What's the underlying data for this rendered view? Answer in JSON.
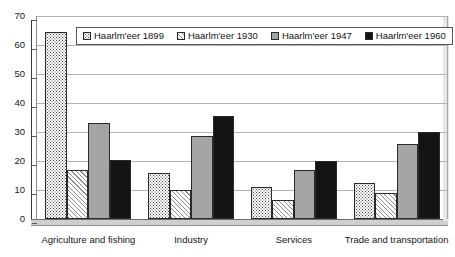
{
  "chart_data": {
    "type": "bar",
    "title": "",
    "subtitle": "",
    "xlabel": "",
    "ylabel": "",
    "ylim": [
      0,
      70
    ],
    "ytick_interval": 10,
    "yticks": [
      "0",
      "10",
      "20",
      "30",
      "40",
      "50",
      "60",
      "70"
    ],
    "grid": true,
    "legend_position": "top-center",
    "categories": [
      "Agriculture and fishing",
      "Industry",
      "Services",
      "Trade and transportation"
    ],
    "series": [
      {
        "name": "Haarlm'eer 1899",
        "pattern": "dots",
        "values": [
          64.5,
          16,
          11,
          12.5
        ]
      },
      {
        "name": "Haarlm'eer 1930",
        "pattern": "diagonal-hatch",
        "values": [
          17,
          10,
          6.5,
          9
        ]
      },
      {
        "name": "Haarlm'eer 1947",
        "pattern": "solid-gray",
        "color": "#a5a5a5",
        "values": [
          33,
          28.5,
          17,
          26
        ]
      },
      {
        "name": "Haarlm'eer 1960",
        "pattern": "solid-black",
        "color": "#141414",
        "values": [
          20.5,
          35.5,
          20,
          30
        ]
      }
    ]
  },
  "legend": {
    "items": [
      {
        "label": "Haarlm'eer 1899"
      },
      {
        "label": "Haarlm'eer 1930"
      },
      {
        "label": "Haarlm'eer 1947"
      },
      {
        "label": "Haarlm'eer 1960"
      }
    ]
  },
  "axis": {
    "y_tick_labels": [
      "70",
      "60",
      "50",
      "40",
      "30",
      "20",
      "10",
      "0"
    ]
  }
}
